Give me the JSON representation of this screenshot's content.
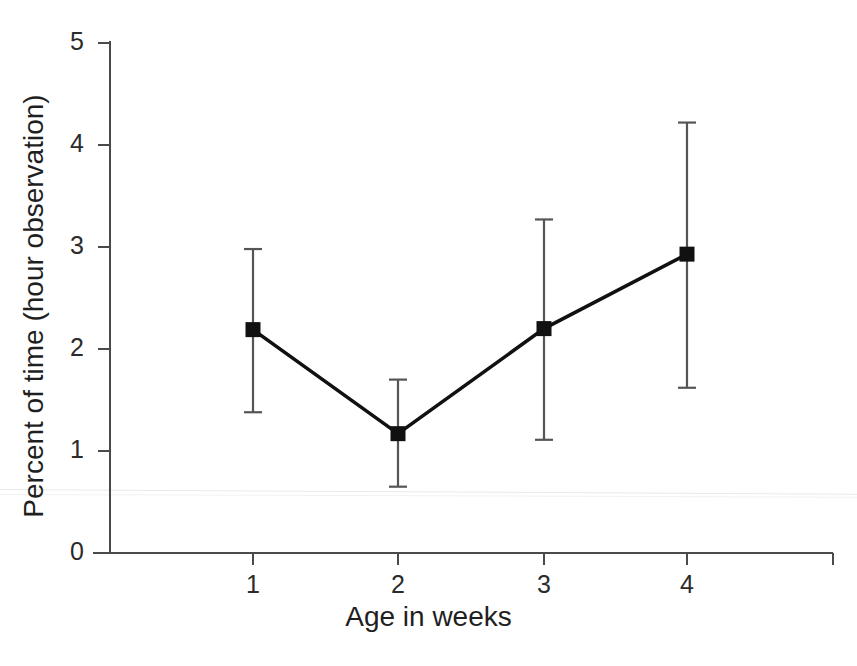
{
  "chart_data": {
    "type": "line",
    "title": "",
    "subtitle": "",
    "xlabel": "Age in weeks",
    "ylabel": "Percent of time (hour observation)",
    "categories": [
      "1",
      "2",
      "3",
      "4"
    ],
    "x": [
      1,
      2,
      3,
      4
    ],
    "values": [
      2.19,
      1.17,
      2.2,
      2.93
    ],
    "error_upper": [
      2.98,
      1.7,
      3.27,
      4.22
    ],
    "error_lower": [
      1.38,
      0.65,
      1.11,
      1.62
    ],
    "series": [
      {
        "name": "Percent of time",
        "values": [
          2.19,
          1.17,
          2.2,
          2.93
        ],
        "error_upper": [
          2.98,
          1.7,
          3.27,
          4.22
        ],
        "error_lower": [
          1.38,
          0.65,
          1.11,
          1.62
        ],
        "marker": "filled-square",
        "color": "#111111"
      }
    ],
    "xlim": [
      0.55,
      4.45
    ],
    "ylim": [
      0,
      5
    ],
    "xticks": [
      1,
      2,
      3,
      4
    ],
    "xtick_labels": [
      "1",
      "2",
      "3",
      "4"
    ],
    "yticks": [
      0,
      1,
      2,
      3,
      4,
      5
    ],
    "ytick_labels": [
      "0",
      "1",
      "2",
      "3",
      "4",
      "5"
    ],
    "grid": false,
    "legend": null,
    "legend_position": "none",
    "annotations": [],
    "line_color": "#111111",
    "axis_color": "#4a4a4a",
    "background": "#ffffff"
  },
  "axes": {
    "x_title": "Age in weeks",
    "y_title": "Percent of time (hour observation)",
    "x_tick_labels": [
      "1",
      "2",
      "3",
      "4"
    ],
    "y_tick_labels": [
      "0",
      "1",
      "2",
      "3",
      "4",
      "5"
    ]
  }
}
